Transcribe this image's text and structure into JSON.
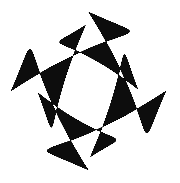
{
  "image": {
    "kind": "glyph-specimen",
    "description": "Single letterform rendered in black on a plain white field",
    "character": "O",
    "script": "Latin",
    "case": "uppercase",
    "style": "serif-didone-high-contrast",
    "width": 180,
    "height": 183
  },
  "colors": {
    "background": "#ffffff",
    "ink": "#0b0b0b"
  },
  "glyph": {
    "label": "O",
    "outer": {
      "cx": 88.5,
      "cy": 91.0,
      "rx": 77.5,
      "ry": 79.0,
      "bbox": {
        "left": 11,
        "top": 12,
        "right": 166,
        "bottom": 170
      }
    },
    "counter": {
      "cx": 88.0,
      "cy": 91.0,
      "rx": 50.0,
      "ry": 66.0,
      "rotation_deg": -2,
      "bbox": {
        "left": 38,
        "top": 25,
        "right": 138,
        "bottom": 157
      }
    },
    "stroke": {
      "thick_left_px": 30,
      "thick_right_px": 29,
      "thin_top_px": 13,
      "thin_bottom_px": 13,
      "contrast_ratio": "2.3:1",
      "stress_axis": "vertical"
    }
  }
}
